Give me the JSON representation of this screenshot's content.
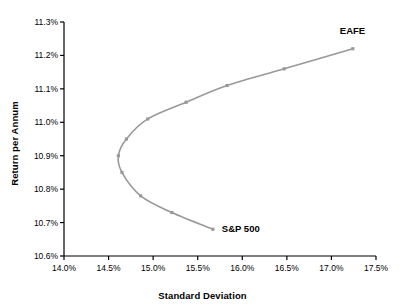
{
  "chart_data": {
    "type": "line",
    "title": "",
    "xlabel": "Standard Deviation",
    "ylabel": "Return per Annum",
    "xlim": [
      14.0,
      17.5
    ],
    "ylim": [
      10.6,
      11.3
    ],
    "xticks": [
      "14.0%",
      "14.5%",
      "15.0%",
      "15.5%",
      "16.0%",
      "16.5%",
      "17.0%",
      "17.5%"
    ],
    "xtick_values": [
      14.0,
      14.5,
      15.0,
      15.5,
      16.0,
      16.5,
      17.0,
      17.5
    ],
    "yticks": [
      "10.6%",
      "10.7%",
      "10.8%",
      "10.9%",
      "11.0%",
      "11.1%",
      "11.2%",
      "11.3%"
    ],
    "ytick_values": [
      10.6,
      10.7,
      10.8,
      10.9,
      11.0,
      11.1,
      11.2,
      11.3
    ],
    "grid": false,
    "legend": "none",
    "series": [
      {
        "name": "efficient-frontier",
        "color": "#999999",
        "marker": "square",
        "x": [
          15.67,
          15.21,
          14.86,
          14.65,
          14.61,
          14.7,
          14.94,
          15.37,
          15.83,
          16.47,
          17.24
        ],
        "y": [
          10.68,
          10.73,
          10.78,
          10.85,
          10.9,
          10.95,
          11.01,
          11.06,
          11.11,
          11.16,
          11.22
        ]
      }
    ],
    "annotations": [
      {
        "text": "EAFE",
        "x": 17.24,
        "y": 11.22,
        "anchor": "above-right"
      },
      {
        "text": "S&P 500",
        "x": 15.67,
        "y": 10.68,
        "anchor": "right"
      }
    ]
  },
  "colors": {
    "curve": "#999999",
    "axis": "#000000",
    "text": "#000000",
    "background": "#ffffff"
  }
}
